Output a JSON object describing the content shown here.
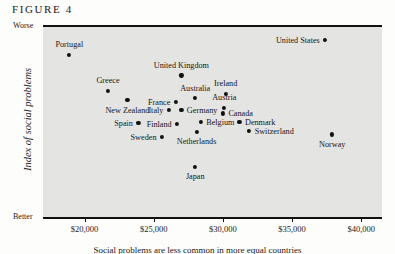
{
  "figure": {
    "label": "FIGURE 4"
  },
  "caption": {
    "text": "Social problems are less common in more equal countries"
  },
  "chart_data": {
    "type": "scatter",
    "title": "FIGURE 4",
    "xlabel": "",
    "ylabel": "Index of social problems",
    "y_axis_top_label": "Worse",
    "y_axis_bottom_label": "Better",
    "grid": false,
    "legend": null,
    "xlim": [
      17000,
      41500
    ],
    "xticks": [
      {
        "value": 20000,
        "label": "$20,000"
      },
      {
        "value": 25000,
        "label": "$25,000"
      },
      {
        "value": 30000,
        "label": "$30,000"
      },
      {
        "value": 35000,
        "label": "$35,000"
      },
      {
        "value": 40000,
        "label": "$40,000"
      }
    ],
    "points": [
      {
        "name": "Portugal",
        "x": 18900,
        "y": 0.855,
        "label_pos": "above"
      },
      {
        "name": "Greece",
        "x": 21700,
        "y": 0.665,
        "label_pos": "above"
      },
      {
        "name": "New Zealand",
        "x": 23100,
        "y": 0.615,
        "label_pos": "below"
      },
      {
        "name": "Spain",
        "x": 23900,
        "y": 0.495,
        "label_pos": "left"
      },
      {
        "name": "United Kingdom",
        "x": 27000,
        "y": 0.745,
        "label_pos": "above"
      },
      {
        "name": "France",
        "x": 26600,
        "y": 0.605,
        "label_pos": "left"
      },
      {
        "name": "Australia",
        "x": 28000,
        "y": 0.625,
        "label_pos": "above"
      },
      {
        "name": "Italy",
        "x": 26100,
        "y": 0.565,
        "label_pos": "left"
      },
      {
        "name": "Germany",
        "x": 27000,
        "y": 0.565,
        "label_pos": "right"
      },
      {
        "name": "Ireland",
        "x": 30200,
        "y": 0.65,
        "label_pos": "above"
      },
      {
        "name": "Austria",
        "x": 30100,
        "y": 0.575,
        "label_pos": "above"
      },
      {
        "name": "Canada",
        "x": 30000,
        "y": 0.545,
        "label_pos": "right"
      },
      {
        "name": "Belgium",
        "x": 28400,
        "y": 0.5,
        "label_pos": "right"
      },
      {
        "name": "Finland",
        "x": 26700,
        "y": 0.49,
        "label_pos": "left"
      },
      {
        "name": "Netherlands",
        "x": 28100,
        "y": 0.45,
        "label_pos": "below"
      },
      {
        "name": "Denmark",
        "x": 31200,
        "y": 0.5,
        "label_pos": "right"
      },
      {
        "name": "Switzerland",
        "x": 31900,
        "y": 0.455,
        "label_pos": "right"
      },
      {
        "name": "Sweden",
        "x": 25600,
        "y": 0.42,
        "label_pos": "left"
      },
      {
        "name": "Japan",
        "x": 28000,
        "y": 0.265,
        "label_pos": "below"
      },
      {
        "name": "Norway",
        "x": 37900,
        "y": 0.435,
        "label_pos": "below"
      },
      {
        "name": "United States",
        "x": 37400,
        "y": 0.93,
        "label_pos": "left"
      }
    ]
  }
}
